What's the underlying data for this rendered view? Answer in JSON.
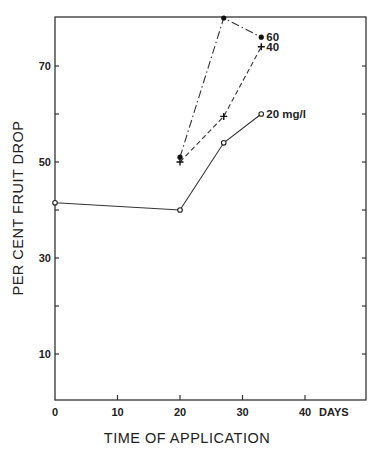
{
  "chart_data": {
    "type": "line",
    "title": "",
    "xlabel": "TIME OF APPLICATION",
    "ylabel": "PER CENT FRUIT DROP",
    "x_unit_label": "DAYS",
    "xlim": [
      0,
      50
    ],
    "ylim": [
      0,
      80
    ],
    "x_ticks": [
      0,
      10,
      20,
      30,
      40
    ],
    "x_tick_labels": [
      "0",
      "10",
      "20",
      "30",
      "40"
    ],
    "y_ticks": [
      10,
      30,
      50,
      70
    ],
    "y_tick_labels": [
      "10",
      "30",
      "50",
      "70"
    ],
    "y_minor_ticks": [
      20,
      40,
      60
    ],
    "grid": false,
    "legend_position": "inline labels at series ends",
    "series": [
      {
        "name": "20 mg/l",
        "label": "20 mg/l",
        "marker": "open-circle",
        "line": "solid",
        "x": [
          0,
          20,
          27,
          33
        ],
        "y": [
          41.5,
          40,
          54,
          60
        ]
      },
      {
        "name": "40",
        "label": "40",
        "marker": "plus",
        "line": "dashed",
        "x": [
          20,
          27,
          33
        ],
        "y": [
          50,
          59.5,
          74
        ]
      },
      {
        "name": "60",
        "label": "60",
        "marker": "filled-circle",
        "line": "dash-dot",
        "x": [
          20,
          27,
          33
        ],
        "y": [
          51,
          80,
          76
        ]
      }
    ]
  }
}
